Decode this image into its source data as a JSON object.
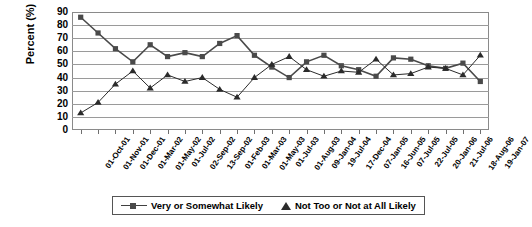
{
  "chart_data": {
    "type": "line",
    "title": "",
    "xlabel": "",
    "ylabel": "Percent (%)",
    "ylim": [
      0,
      90
    ],
    "ytick_step": 10,
    "yticks": [
      90,
      80,
      70,
      60,
      50,
      40,
      30,
      20,
      10,
      0
    ],
    "grid": true,
    "legend_position": "bottom",
    "categories": [
      "01-Oct-01",
      "01-Nov-01",
      "01-Dec-01",
      "01-Mar-02",
      "01-May-02",
      "01-Jul-02",
      "02-Sep-02",
      "13-Sep-02",
      "01-Feb-03",
      "01-Mar-03",
      "01-May-03",
      "01-Jul-03",
      "01-Aug-03",
      "09-Jan-04",
      "19-Jul-04",
      "17-Dec-04",
      "07-Jan-05",
      "16-Jun-05",
      "07-Jul-05",
      "22-Jul-05",
      "20-Jan-06",
      "21-Jul-06",
      "18-Aug-06",
      "19-Jan-07"
    ],
    "series": [
      {
        "name": "Very or Somewhat Likely",
        "marker": "square",
        "color": "#4a4a4a",
        "values": [
          86,
          74,
          62,
          52,
          65,
          56,
          59,
          56,
          66,
          72,
          57,
          48,
          40,
          52,
          57,
          49,
          46,
          41,
          55,
          54,
          49,
          47,
          51,
          37
        ]
      },
      {
        "name": "Not Too or Not at All Likely",
        "marker": "triangle",
        "color": "#2b2b2b",
        "values": [
          13,
          21,
          35,
          45,
          32,
          42,
          37,
          40,
          31,
          25,
          40,
          50,
          56,
          46,
          41,
          45,
          44,
          54,
          42,
          43,
          48,
          47,
          42,
          57
        ]
      }
    ]
  },
  "legend": {
    "entries": [
      {
        "label": "Very or Somewhat Likely",
        "marker": "square-line-marker"
      },
      {
        "label": "Not Too or Not at All Likely",
        "marker": "triangle-marker"
      }
    ]
  },
  "axis": {
    "y_title": "Percent (%)"
  },
  "colors": {
    "series_a": "#4a4a4a",
    "series_b": "#2b2b2b",
    "gridline": "#9a9a9a",
    "frame": "#8a8a8a",
    "text": "#000000"
  }
}
